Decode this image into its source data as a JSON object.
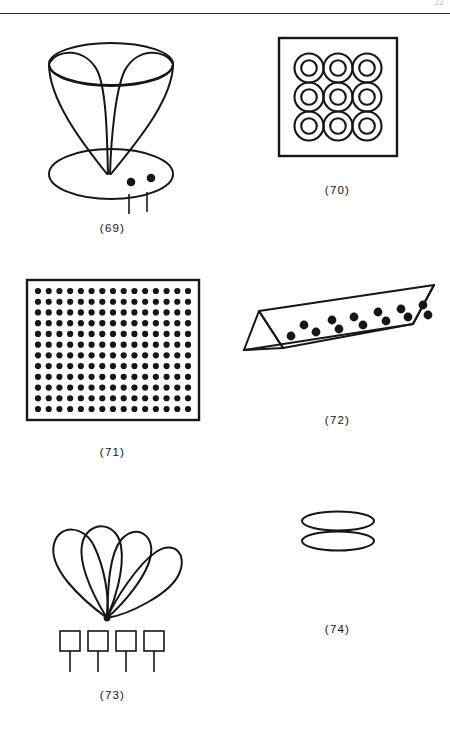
{
  "page": {
    "page_number": "22",
    "width": 450,
    "height": 730,
    "background_color": "#ffffff",
    "ink_color": "#161616",
    "has_header_rule": true
  },
  "figures": [
    {
      "id": "69",
      "caption": "(69)",
      "name": "cone-over-ellipse-with-dots",
      "description": "Inverted cone / funnel drawn with two crossing curved generatrix lines meeting at an apex, an open elliptical mouth at the top and an inner ellipse, resting on a large flat ellipse base. Two filled dots sit on the base to the right of the apex and two short vertical stems descend below the base.",
      "elements": {
        "top_ellipse_rx": 60,
        "top_ellipse_ry": 20,
        "inner_ellipse_ry": 12,
        "base_ellipse_rx": 60,
        "base_ellipse_ry": 24,
        "dot_count": 2,
        "stem_count": 2
      }
    },
    {
      "id": "70",
      "caption": "(70)",
      "name": "square-with-nine-concentric-rings",
      "description": "A square outline containing a 3 by 3 grid of concentric double circles (annuli / donuts).",
      "elements": {
        "square_size": 112,
        "rows": 3,
        "cols": 3,
        "ring_outer_r": 14,
        "ring_inner_r": 7.5,
        "ring_count": 9
      }
    },
    {
      "id": "71",
      "caption": "(71)",
      "name": "rectangle-with-dot-grid",
      "description": "A rectangle outline densely filled with a regular grid of small filled dots.",
      "elements": {
        "rect_width": 172,
        "rect_height": 140,
        "rows": 12,
        "cols": 15,
        "dot_radius": 3.1,
        "dot_total": 180
      }
    },
    {
      "id": "72",
      "caption": "(72)",
      "name": "triangular-prism-with-dots",
      "description": "An elongated triangular prism (toblerone-like bar) seen in oblique view, tilted up to the right, with two staggered rows of filled dots on its visible upper face.",
      "elements": {
        "dots_top_row": 6,
        "dots_bottom_row": 7,
        "dot_radius": 4.2,
        "dot_total": 13
      }
    },
    {
      "id": "73",
      "caption": "(73)",
      "name": "four-petals-over-four-squares",
      "description": "Four long teardrop / petal loops fanning out and converging to a single point at the bottom, with a row of four small squares on short vertical stems beneath.",
      "elements": {
        "petal_count": 4,
        "square_count": 4,
        "square_size": 19,
        "stem_length": 22
      }
    },
    {
      "id": "74",
      "caption": "(74)",
      "name": "two-stacked-flat-ellipses",
      "description": "Two thin flat ellipses stacked one above the other with a small gap.",
      "elements": {
        "ellipse_count": 2,
        "ellipse_rx": 35,
        "ellipse_ry": 9,
        "gap": 6
      }
    }
  ]
}
